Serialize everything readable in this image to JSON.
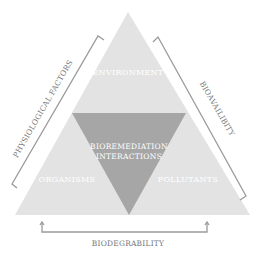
{
  "diagram": {
    "outer_triangle": {
      "points": [
        [
          128,
          12
        ],
        [
          15,
          215
        ],
        [
          250,
          215
        ]
      ],
      "fill": "#e3e3e3"
    },
    "inner_triangle": {
      "points": [
        [
          72,
          113
        ],
        [
          186,
          113
        ],
        [
          129,
          215
        ]
      ],
      "fill": "#a6a6a6"
    },
    "regions": {
      "top": "ENVIRONMENT",
      "left": "ORGANISMS",
      "right": "POLLUTANTS",
      "center_line1": "BIOREMEDIATION",
      "center_line2": "INTERACTIONS"
    },
    "edges": {
      "left": "PHYSIOLOGICAL FACTORS",
      "right": "BIOAVAILIBITY",
      "bottom": "BIODEGRABILITY"
    },
    "colors": {
      "region_text": "#ffffff",
      "edge_text": "#777777",
      "bracket_line": "#9a9a9a"
    }
  }
}
